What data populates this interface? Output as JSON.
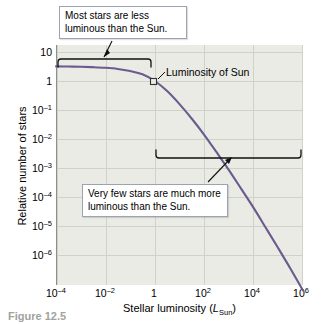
{
  "figure": {
    "caption_partial": "Figure 12.5"
  },
  "chart_data": {
    "type": "line",
    "title": "",
    "xlabel": "Stellar luminosity (L_Sun)",
    "xlabel_main": "Stellar luminosity (",
    "xlabel_italic": "L",
    "xlabel_sub": "Sun",
    "xlabel_close": ")",
    "ylabel": "Relative number of stars",
    "grid": true,
    "legend": "none",
    "xscale": "log",
    "yscale": "log",
    "xlim": [
      0.0001,
      1000000
    ],
    "ylim": [
      1e-07,
      30
    ],
    "xticks": [
      {
        "label": "10",
        "sup": "–4",
        "value": 0.0001
      },
      {
        "label": "10",
        "sup": "–2",
        "value": 0.01
      },
      {
        "label": "1",
        "sup": "",
        "value": 1
      },
      {
        "label": "10",
        "sup": "2",
        "value": 100
      },
      {
        "label": "10",
        "sup": "4",
        "value": 10000
      },
      {
        "label": "10",
        "sup": "6",
        "value": 1000000
      }
    ],
    "yticks": [
      {
        "label": "10",
        "sup": "",
        "value": 10
      },
      {
        "label": "1",
        "sup": "",
        "value": 1
      },
      {
        "label": "10",
        "sup": "–1",
        "value": 0.1
      },
      {
        "label": "10",
        "sup": "–2",
        "value": 0.01
      },
      {
        "label": "10",
        "sup": "–3",
        "value": 0.001
      },
      {
        "label": "10",
        "sup": "–4",
        "value": 0.0001
      },
      {
        "label": "10",
        "sup": "–5",
        "value": 1e-05
      },
      {
        "label": "10",
        "sup": "–6",
        "value": 1e-06
      }
    ],
    "series": [
      {
        "name": "Relative number of stars vs luminosity",
        "color": "#6b5b8f",
        "points": [
          {
            "x": 0.0001,
            "y": 3.2
          },
          {
            "x": 0.000316,
            "y": 3.15
          },
          {
            "x": 0.001,
            "y": 3.1
          },
          {
            "x": 0.00316,
            "y": 3.0
          },
          {
            "x": 0.01,
            "y": 2.85
          },
          {
            "x": 0.0316,
            "y": 2.6
          },
          {
            "x": 0.1,
            "y": 2.2
          },
          {
            "x": 0.316,
            "y": 1.7
          },
          {
            "x": 1,
            "y": 1.0
          },
          {
            "x": 3.16,
            "y": 0.45
          },
          {
            "x": 10,
            "y": 0.16
          },
          {
            "x": 31.6,
            "y": 0.05
          },
          {
            "x": 100,
            "y": 0.014
          },
          {
            "x": 316,
            "y": 0.0035
          },
          {
            "x": 1000,
            "y": 0.00085
          },
          {
            "x": 3160,
            "y": 0.00019
          },
          {
            "x": 10000,
            "y": 4.2e-05
          },
          {
            "x": 31600,
            "y": 8.5e-06
          },
          {
            "x": 100000,
            "y": 1.7e-06
          },
          {
            "x": 316000,
            "y": 3.3e-07
          },
          {
            "x": 1000000,
            "y": 6e-08
          }
        ]
      }
    ],
    "annotations": [
      {
        "id": "callout-top",
        "text": "Most stars are less luminous than the Sun.",
        "line1": "Most stars are less",
        "line2": "luminous than the Sun.",
        "bracket": {
          "from_x": 0.0001,
          "to_x": 1,
          "orientation": "down"
        }
      },
      {
        "id": "callout-bottom",
        "text": "Very few stars are much more luminous than the Sun.",
        "line1": "Very few stars are much more",
        "line2": "luminous than the Sun.",
        "bracket": {
          "from_x": 1,
          "to_x": 1000000,
          "orientation": "up"
        }
      },
      {
        "id": "sun-marker",
        "text": "Luminosity of Sun",
        "marker": "open-square",
        "at_x": 1,
        "at_y": 1
      }
    ]
  }
}
